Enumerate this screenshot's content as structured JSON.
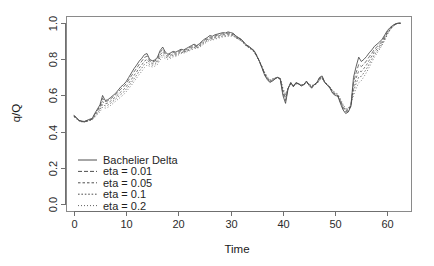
{
  "chart_data": {
    "type": "line",
    "title": "",
    "xlabel": "Time",
    "ylabel": "q/Q",
    "xlim": [
      -1.5,
      64.5
    ],
    "ylim": [
      -0.04,
      1.04
    ],
    "xticks": [
      0,
      10,
      20,
      30,
      40,
      50,
      60
    ],
    "xtick_labels": [
      "0",
      "10",
      "20",
      "30",
      "40",
      "50",
      "60"
    ],
    "yticks": [
      0.0,
      0.2,
      0.4,
      0.6,
      0.8,
      1.0
    ],
    "ytick_labels": [
      "0.0",
      "0.2",
      "0.4",
      "0.6",
      "0.8",
      "1.0"
    ],
    "grid": false,
    "legend_position": "bottom-left",
    "legend_entries": [
      {
        "label": "Bachelier Delta",
        "dash": "none"
      },
      {
        "label": "eta = 0.01",
        "dash": "4,2"
      },
      {
        "label": "eta = 0.05",
        "dash": "2.5,2"
      },
      {
        "label": "eta = 0.1",
        "dash": "1.6,1.8"
      },
      {
        "label": "eta = 0.2",
        "dash": "0.9,2.1"
      }
    ],
    "x": [
      0,
      0.5,
      1,
      1.5,
      2,
      2.5,
      3,
      3.5,
      4,
      4.5,
      5,
      5.5,
      6,
      6.5,
      7,
      7.5,
      8,
      8.5,
      9,
      9.5,
      10,
      10.5,
      11,
      11.5,
      12,
      12.5,
      13,
      13.5,
      14,
      14.5,
      15,
      15.5,
      16,
      16.5,
      17,
      17.5,
      18,
      18.5,
      19,
      19.5,
      20,
      20.5,
      21,
      21.5,
      22,
      22.5,
      23,
      23.5,
      24,
      24.5,
      25,
      25.5,
      26,
      26.5,
      27,
      27.5,
      28,
      28.5,
      29,
      29.5,
      30,
      30.5,
      31,
      31.5,
      32,
      32.5,
      33,
      33.5,
      34,
      34.5,
      35,
      35.5,
      36,
      36.5,
      37,
      37.5,
      38,
      38.5,
      39,
      39.5,
      40,
      40.5,
      41,
      41.5,
      42,
      42.5,
      43,
      43.5,
      44,
      44.5,
      45,
      45.5,
      46,
      46.5,
      47,
      47.5,
      48,
      48.5,
      49,
      49.5,
      50,
      50.5,
      51,
      51.5,
      52,
      52.5,
      53,
      53.5,
      54,
      54.5,
      55,
      55.5,
      56,
      56.5,
      57,
      57.5,
      58,
      58.5,
      59,
      59.5,
      60,
      60.5,
      61,
      61.5,
      62,
      62.5
    ],
    "series": [
      {
        "name": "Bachelier Delta",
        "dash": "none",
        "values": [
          0.49,
          0.478,
          0.462,
          0.458,
          0.456,
          0.462,
          0.468,
          0.472,
          0.5,
          0.524,
          0.548,
          0.6,
          0.572,
          0.576,
          0.588,
          0.6,
          0.612,
          0.63,
          0.648,
          0.66,
          0.676,
          0.7,
          0.724,
          0.748,
          0.768,
          0.79,
          0.806,
          0.826,
          0.832,
          0.8,
          0.792,
          0.796,
          0.812,
          0.848,
          0.868,
          0.84,
          0.828,
          0.836,
          0.844,
          0.84,
          0.848,
          0.856,
          0.852,
          0.86,
          0.868,
          0.876,
          0.884,
          0.876,
          0.886,
          0.9,
          0.912,
          0.92,
          0.932,
          0.928,
          0.936,
          0.94,
          0.944,
          0.948,
          0.946,
          0.952,
          0.948,
          0.944,
          0.93,
          0.92,
          0.912,
          0.896,
          0.88,
          0.872,
          0.86,
          0.848,
          0.82,
          0.788,
          0.752,
          0.712,
          0.688,
          0.672,
          0.68,
          0.692,
          0.7,
          0.688,
          0.6,
          0.556,
          0.64,
          0.672,
          0.648,
          0.672,
          0.664,
          0.652,
          0.66,
          0.68,
          0.656,
          0.64,
          0.66,
          0.672,
          0.7,
          0.708,
          0.672,
          0.656,
          0.64,
          0.612,
          0.6,
          0.596,
          0.556,
          0.52,
          0.5,
          0.508,
          0.54,
          0.7,
          0.76,
          0.812,
          0.788,
          0.8,
          0.816,
          0.836,
          0.852,
          0.872,
          0.884,
          0.896,
          0.912,
          0.936,
          0.96,
          0.976,
          0.988,
          0.996,
          1.0,
          1.0
        ]
      },
      {
        "name": "eta = 0.01",
        "dash": "4,2",
        "values": [
          0.488,
          0.476,
          0.461,
          0.457,
          0.455,
          0.46,
          0.466,
          0.47,
          0.496,
          0.518,
          0.54,
          0.584,
          0.566,
          0.57,
          0.58,
          0.592,
          0.604,
          0.62,
          0.636,
          0.648,
          0.664,
          0.686,
          0.708,
          0.73,
          0.75,
          0.772,
          0.79,
          0.81,
          0.818,
          0.792,
          0.786,
          0.79,
          0.804,
          0.838,
          0.856,
          0.832,
          0.822,
          0.83,
          0.838,
          0.834,
          0.842,
          0.85,
          0.848,
          0.854,
          0.862,
          0.87,
          0.878,
          0.872,
          0.88,
          0.894,
          0.906,
          0.914,
          0.924,
          0.922,
          0.93,
          0.934,
          0.938,
          0.942,
          0.94,
          0.946,
          0.944,
          0.94,
          0.928,
          0.918,
          0.91,
          0.894,
          0.878,
          0.87,
          0.858,
          0.846,
          0.82,
          0.79,
          0.754,
          0.716,
          0.692,
          0.676,
          0.682,
          0.692,
          0.7,
          0.69,
          0.612,
          0.572,
          0.64,
          0.67,
          0.65,
          0.67,
          0.664,
          0.654,
          0.66,
          0.678,
          0.658,
          0.644,
          0.66,
          0.67,
          0.696,
          0.704,
          0.672,
          0.658,
          0.642,
          0.616,
          0.604,
          0.598,
          0.562,
          0.528,
          0.508,
          0.514,
          0.542,
          0.672,
          0.726,
          0.772,
          0.76,
          0.774,
          0.792,
          0.814,
          0.834,
          0.856,
          0.87,
          0.884,
          0.902,
          0.928,
          0.954,
          0.972,
          0.986,
          0.995,
          1.0,
          1.0
        ]
      },
      {
        "name": "eta = 0.05",
        "dash": "2.5,2",
        "values": [
          0.486,
          0.474,
          0.46,
          0.456,
          0.454,
          0.458,
          0.464,
          0.468,
          0.49,
          0.51,
          0.53,
          0.566,
          0.554,
          0.558,
          0.568,
          0.58,
          0.592,
          0.606,
          0.62,
          0.632,
          0.648,
          0.668,
          0.688,
          0.71,
          0.73,
          0.752,
          0.77,
          0.79,
          0.8,
          0.782,
          0.778,
          0.782,
          0.794,
          0.824,
          0.842,
          0.824,
          0.816,
          0.822,
          0.83,
          0.828,
          0.836,
          0.844,
          0.842,
          0.848,
          0.856,
          0.864,
          0.872,
          0.868,
          0.876,
          0.888,
          0.9,
          0.908,
          0.918,
          0.916,
          0.924,
          0.928,
          0.932,
          0.936,
          0.936,
          0.94,
          0.938,
          0.936,
          0.924,
          0.916,
          0.908,
          0.892,
          0.876,
          0.868,
          0.856,
          0.844,
          0.818,
          0.79,
          0.756,
          0.72,
          0.696,
          0.68,
          0.686,
          0.694,
          0.7,
          0.692,
          0.622,
          0.586,
          0.64,
          0.668,
          0.652,
          0.668,
          0.664,
          0.656,
          0.66,
          0.676,
          0.66,
          0.648,
          0.66,
          0.668,
          0.692,
          0.7,
          0.672,
          0.66,
          0.644,
          0.62,
          0.608,
          0.6,
          0.568,
          0.536,
          0.514,
          0.52,
          0.544,
          0.646,
          0.696,
          0.736,
          0.732,
          0.75,
          0.77,
          0.794,
          0.818,
          0.842,
          0.858,
          0.874,
          0.894,
          0.92,
          0.948,
          0.968,
          0.984,
          0.994,
          1.0,
          1.0
        ]
      },
      {
        "name": "eta = 0.1",
        "dash": "1.6,1.8",
        "values": [
          0.484,
          0.472,
          0.459,
          0.455,
          0.453,
          0.457,
          0.462,
          0.466,
          0.484,
          0.502,
          0.52,
          0.55,
          0.542,
          0.546,
          0.556,
          0.568,
          0.58,
          0.594,
          0.606,
          0.618,
          0.634,
          0.652,
          0.672,
          0.692,
          0.712,
          0.734,
          0.752,
          0.772,
          0.784,
          0.772,
          0.768,
          0.772,
          0.784,
          0.81,
          0.828,
          0.814,
          0.808,
          0.814,
          0.822,
          0.822,
          0.83,
          0.838,
          0.838,
          0.844,
          0.85,
          0.858,
          0.866,
          0.864,
          0.87,
          0.882,
          0.894,
          0.902,
          0.912,
          0.912,
          0.918,
          0.922,
          0.926,
          0.93,
          0.93,
          0.934,
          0.934,
          0.932,
          0.92,
          0.912,
          0.904,
          0.89,
          0.874,
          0.866,
          0.854,
          0.842,
          0.816,
          0.79,
          0.758,
          0.724,
          0.7,
          0.684,
          0.69,
          0.696,
          0.7,
          0.694,
          0.632,
          0.598,
          0.64,
          0.664,
          0.654,
          0.666,
          0.664,
          0.658,
          0.66,
          0.674,
          0.662,
          0.652,
          0.66,
          0.666,
          0.688,
          0.696,
          0.672,
          0.66,
          0.646,
          0.624,
          0.612,
          0.604,
          0.574,
          0.544,
          0.52,
          0.526,
          0.546,
          0.622,
          0.666,
          0.702,
          0.706,
          0.726,
          0.748,
          0.774,
          0.8,
          0.826,
          0.846,
          0.864,
          0.886,
          0.912,
          0.942,
          0.964,
          0.982,
          0.993,
          1.0,
          1.0
        ]
      },
      {
        "name": "eta = 0.2",
        "dash": "0.9,2.1",
        "values": [
          0.482,
          0.47,
          0.458,
          0.454,
          0.452,
          0.456,
          0.46,
          0.464,
          0.478,
          0.494,
          0.51,
          0.534,
          0.53,
          0.534,
          0.544,
          0.556,
          0.568,
          0.58,
          0.592,
          0.604,
          0.62,
          0.638,
          0.656,
          0.676,
          0.696,
          0.716,
          0.734,
          0.754,
          0.768,
          0.762,
          0.758,
          0.762,
          0.772,
          0.796,
          0.814,
          0.804,
          0.8,
          0.806,
          0.814,
          0.816,
          0.824,
          0.832,
          0.834,
          0.84,
          0.846,
          0.852,
          0.86,
          0.86,
          0.866,
          0.876,
          0.888,
          0.896,
          0.906,
          0.906,
          0.912,
          0.916,
          0.92,
          0.924,
          0.926,
          0.928,
          0.928,
          0.928,
          0.918,
          0.91,
          0.902,
          0.888,
          0.872,
          0.864,
          0.852,
          0.84,
          0.814,
          0.79,
          0.76,
          0.728,
          0.704,
          0.688,
          0.692,
          0.698,
          0.7,
          0.696,
          0.64,
          0.608,
          0.64,
          0.66,
          0.656,
          0.664,
          0.664,
          0.66,
          0.66,
          0.672,
          0.664,
          0.656,
          0.66,
          0.664,
          0.684,
          0.692,
          0.672,
          0.662,
          0.648,
          0.628,
          0.616,
          0.608,
          0.58,
          0.552,
          0.526,
          0.532,
          0.548,
          0.6,
          0.638,
          0.67,
          0.682,
          0.704,
          0.728,
          0.756,
          0.784,
          0.812,
          0.834,
          0.856,
          0.88,
          0.906,
          0.938,
          0.962,
          0.98,
          0.992,
          1.0,
          1.0
        ]
      }
    ]
  }
}
